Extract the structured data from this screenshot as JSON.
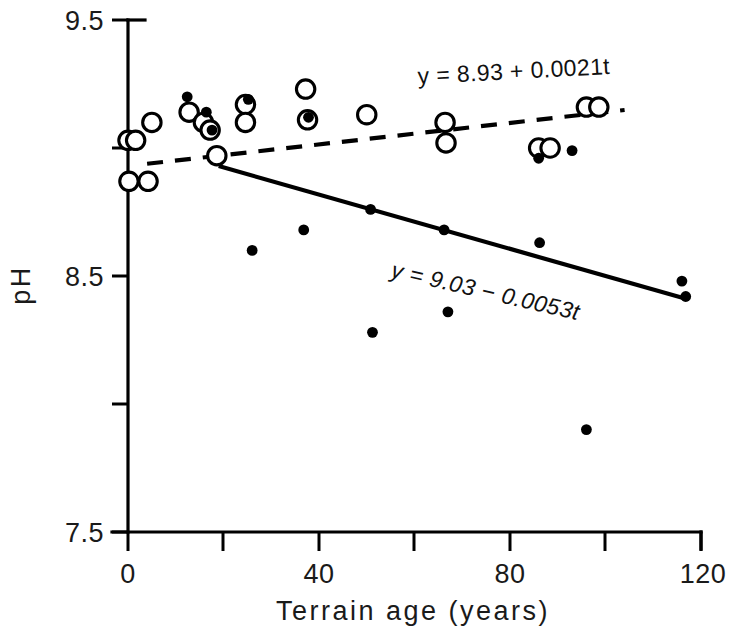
{
  "chart_data": {
    "type": "scatter",
    "title": "",
    "xlabel": "Terrain age (years)",
    "ylabel": "pH",
    "xlim": [
      0,
      120
    ],
    "ylim": [
      7.5,
      9.5
    ],
    "grid": false,
    "legend_position": "none",
    "x_ticks_major": [
      0,
      40,
      80,
      120
    ],
    "x_ticks_major_labels": [
      "0",
      "40",
      "80",
      "120"
    ],
    "x_ticks_minor": [
      20,
      60,
      100
    ],
    "y_ticks_major": [
      7.5,
      8.5,
      9.5
    ],
    "y_ticks_major_labels": [
      "7.5",
      "8.5",
      "9.5"
    ],
    "y_ticks_minor": [
      8.0,
      9.0
    ],
    "series": [
      {
        "name": "open-circles",
        "marker": "open circle",
        "color": "#000000",
        "points": [
          [
            0.0,
            9.03
          ],
          [
            1.6,
            9.03
          ],
          [
            0.2,
            8.87
          ],
          [
            4.2,
            8.87
          ],
          [
            5.0,
            9.1
          ],
          [
            12.8,
            9.14
          ],
          [
            15.8,
            9.1
          ],
          [
            17.2,
            9.07
          ],
          [
            18.6,
            8.97
          ],
          [
            24.6,
            9.17
          ],
          [
            24.6,
            9.1
          ],
          [
            37.2,
            9.23
          ],
          [
            37.6,
            9.11
          ],
          [
            50.0,
            9.13
          ],
          [
            66.4,
            9.1
          ],
          [
            66.6,
            9.02
          ],
          [
            86.0,
            9.0
          ],
          [
            88.4,
            9.0
          ],
          [
            96.0,
            9.16
          ],
          [
            98.6,
            9.16
          ]
        ]
      },
      {
        "name": "filled-circles",
        "marker": "filled circle",
        "color": "#000000",
        "points": [
          [
            12.4,
            9.2
          ],
          [
            16.4,
            9.14
          ],
          [
            17.6,
            9.07
          ],
          [
            25.2,
            9.19
          ],
          [
            26.0,
            8.6
          ],
          [
            36.8,
            8.68
          ],
          [
            37.8,
            9.12
          ],
          [
            50.8,
            8.76
          ],
          [
            51.2,
            8.28
          ],
          [
            66.2,
            8.68
          ],
          [
            67.0,
            8.36
          ],
          [
            86.2,
            8.63
          ],
          [
            86.0,
            8.96
          ],
          [
            93.0,
            8.99
          ],
          [
            96.0,
            7.9
          ],
          [
            116.0,
            8.48
          ],
          [
            116.8,
            8.42
          ]
        ]
      }
    ],
    "fit_lines": [
      {
        "name": "dashed-fit",
        "style": "dashed",
        "equation": "y = 8.93 + 0.0021t",
        "intercept": 8.93,
        "slope": 0.0021,
        "x_start": 4,
        "x_end": 104
      },
      {
        "name": "solid-fit",
        "style": "solid",
        "equation": "y = 9.03 - 0.0053t",
        "intercept": 9.03,
        "slope": -0.0053,
        "x_start": 19,
        "x_end": 117
      }
    ],
    "annotations": [
      {
        "name": "dashed-equation-label",
        "text": "y = 8.93 + 0.0021t",
        "x_px": 418,
        "y_px": 84,
        "rotation": -3,
        "italic": false
      },
      {
        "name": "solid-equation-label",
        "text": "y = 9.03 - 0.0053t",
        "x_px": 390,
        "y_px": 277,
        "rotation": 13,
        "italic": true
      }
    ]
  }
}
